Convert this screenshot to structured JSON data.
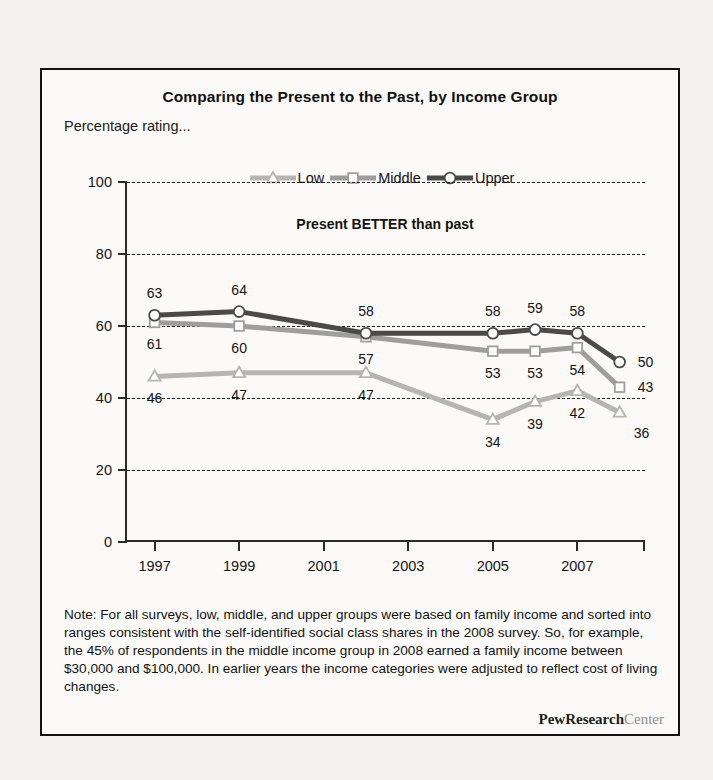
{
  "figure": {
    "title": "Comparing the Present to the Past, by Income Group",
    "subtitle": "Percentage rating...",
    "annotation": "Present BETTER than past",
    "note": "Note: For all surveys, low, middle, and upper groups were based on family income and sorted into ranges consistent with the self-identified social class shares in the 2008 survey. So, for example, the 45% of respondents in the middle income group in 2008 earned a family income between $30,000 and $100,000. In earlier years the income categories were adjusted to  reflect cost of living changes.",
    "brand_bold": "PewResearch",
    "brand_light": "Center"
  },
  "chart_data": {
    "type": "line",
    "title": "Comparing the Present to the Past, by Income Group",
    "subtitle": "Percentage rating...",
    "annotation": "Present BETTER than past",
    "xlabel": "",
    "ylabel": "",
    "ylim": [
      0,
      100
    ],
    "yticks": [
      0,
      20,
      40,
      60,
      80,
      100
    ],
    "ytick_labels": [
      "0",
      "20",
      "40",
      "60",
      "80",
      "100"
    ],
    "xlim": [
      1996.3,
      2008.6
    ],
    "xticks": [
      1997,
      1999,
      2001,
      2003,
      2005,
      2007
    ],
    "xtick_labels": [
      "1997",
      "1999",
      "2001",
      "2003",
      "2005",
      "2007"
    ],
    "grid": "horizontal-dashed",
    "legend_position": "top-center",
    "x": [
      1997,
      1999,
      2002,
      2005,
      2006,
      2007,
      2008
    ],
    "series": [
      {
        "name": "Low",
        "marker": "triangle",
        "color": "#b5b5b5",
        "values": [
          46,
          47,
          47,
          34,
          39,
          42,
          36
        ],
        "labels": [
          "46",
          "47",
          "47",
          "34",
          "39",
          "42",
          "36"
        ]
      },
      {
        "name": "Middle",
        "marker": "square",
        "color": "#9e9e9e",
        "values": [
          61,
          60,
          57,
          53,
          53,
          54,
          43
        ],
        "labels": [
          "61",
          "60",
          "57",
          "53",
          "53",
          "54",
          "43"
        ]
      },
      {
        "name": "Upper",
        "marker": "circle",
        "color": "#4a4a4a",
        "values": [
          63,
          64,
          58,
          58,
          59,
          58,
          50
        ],
        "labels": [
          "63",
          "64",
          "58",
          "58",
          "59",
          "58",
          "50"
        ]
      }
    ]
  }
}
